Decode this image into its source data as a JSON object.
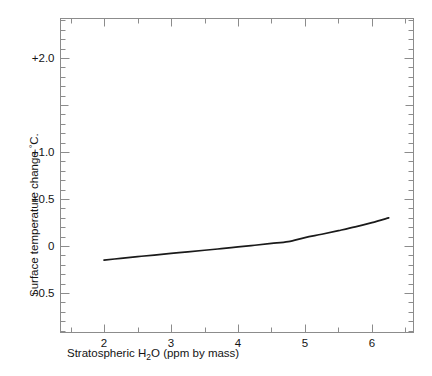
{
  "chart_data": {
    "type": "line",
    "title": "",
    "xlabel": "Stratospheric H₂O (ppm by mass)",
    "ylabel": "Surface temperature change °C.",
    "xlabel_parts": {
      "pre": "Stratospheric H",
      "sub": "2",
      "post": "O (ppm by mass)"
    },
    "ylabel_parts": {
      "pre": "Surface temperature change ",
      "sup": "°",
      "post": "C."
    },
    "xlim": [
      1.35,
      6.62
    ],
    "ylim": [
      -0.92,
      2.42
    ],
    "grid": false,
    "legend": null,
    "xticks": [
      2,
      3,
      4,
      5,
      6
    ],
    "xtick_labels": [
      "2",
      "3",
      "4",
      "5",
      "6"
    ],
    "xminor_step": 0.5,
    "yticks": [
      2.0,
      1.0,
      0.5,
      0.0,
      -0.5
    ],
    "ytick_labels": [
      "+2.0",
      "+1.0",
      "+0.5",
      "0",
      "-0.5"
    ],
    "yminor_step": 0.1,
    "ymedium_ticks": [
      1.5
    ],
    "series": [
      {
        "name": "surface temperature change",
        "color": "#1a1a1a",
        "x": [
          2.0,
          2.25,
          2.5,
          2.75,
          3.0,
          3.25,
          3.5,
          3.75,
          4.0,
          4.25,
          4.5,
          4.75,
          5.0,
          5.25,
          5.5,
          5.75,
          6.0,
          6.25
        ],
        "y": [
          -0.15,
          -0.131,
          -0.113,
          -0.096,
          -0.079,
          -0.062,
          -0.045,
          -0.028,
          -0.01,
          0.008,
          0.027,
          0.047,
          0.09,
          0.125,
          0.163,
          0.203,
          0.248,
          0.3
        ]
      }
    ]
  },
  "axes": {
    "frame_color": "#8c8c8c",
    "tick_color": "#8c8c8c",
    "curve_color": "#1a1a1a"
  }
}
